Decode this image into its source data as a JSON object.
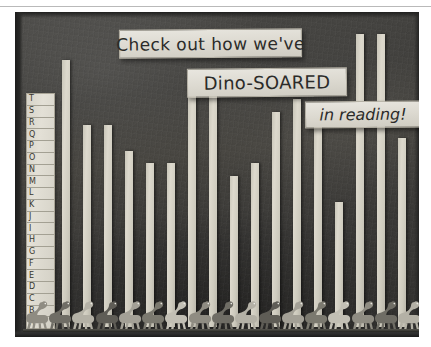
{
  "image": {
    "kind": "classroom-bulletin-board-photo",
    "background_color": "#403f3c",
    "bar_color": "#d5d2c5",
    "sign_color": "#e2dfd6"
  },
  "signs": [
    {
      "id": "sign-line-1",
      "text": "Check out how we've"
    },
    {
      "id": "sign-line-2",
      "text": "Dino-SOARED"
    },
    {
      "id": "sign-line-3",
      "text": "in reading!"
    }
  ],
  "axis": {
    "title": "reading level",
    "labels_bottom_to_top": [
      "A",
      "B",
      "C",
      "D",
      "E",
      "F",
      "G",
      "H",
      "I",
      "J",
      "K",
      "L",
      "M",
      "N",
      "O",
      "P",
      "Q",
      "R",
      "S",
      "T"
    ]
  },
  "chart_data": {
    "type": "bar",
    "title": "Check out how we've Dino-SOARED in reading!",
    "xlabel": "",
    "ylabel": "reading level",
    "ylim": [
      0,
      20
    ],
    "grid": true,
    "legend": "none",
    "categories": [
      "1",
      "2",
      "3",
      "4",
      "5",
      "6",
      "7",
      "8",
      "9",
      "10",
      "11",
      "12",
      "13",
      "14",
      "15",
      "16",
      "17"
    ],
    "tick_labels": [
      "A",
      "B",
      "C",
      "D",
      "E",
      "F",
      "G",
      "H",
      "I",
      "J",
      "K",
      "L",
      "M",
      "N",
      "O",
      "P",
      "Q",
      "R",
      "S",
      "T"
    ],
    "values": [
      18,
      13,
      13,
      11,
      10,
      10,
      16,
      16,
      9,
      10,
      14,
      15,
      14,
      7,
      20,
      20,
      12
    ],
    "value_letters": [
      "R",
      "M",
      "M",
      "K",
      "J",
      "J",
      "P",
      "P",
      "I",
      "J",
      "N",
      "O",
      "N",
      "G",
      "T",
      "T",
      "L"
    ]
  },
  "dinosaurs": {
    "count": 17,
    "shape": "long-neck-sauropod"
  }
}
